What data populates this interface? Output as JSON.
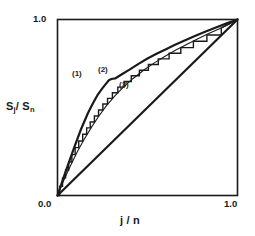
{
  "figure": {
    "kind": "lorenz-curve-plot",
    "background": "#ffffff",
    "ink": "#1a1a1a"
  },
  "axes": {
    "x_label": "j / n",
    "y_label_main": "S",
    "y_label_sub1": "j",
    "y_label_slash": "/ S",
    "y_label_sub2": "n",
    "y_label_plain": "Sj / Sn",
    "tick_origin": "0.0",
    "tick_x_right": "1.0",
    "tick_y_top": "1.0"
  },
  "curve_labels": {
    "one": "(1)",
    "two": "(2)",
    "three": "(3)"
  },
  "chart_data": {
    "type": "line",
    "title": "",
    "xlabel": "j / n",
    "ylabel": "Sj / Sn",
    "xlim": [
      0.0,
      1.0
    ],
    "ylim": [
      0.0,
      1.0
    ],
    "grid": false,
    "legend": "inline-annotations",
    "xticks": [
      0.0,
      1.0
    ],
    "yticks": [
      0.0,
      1.0
    ],
    "xticklabels": [
      "0.0",
      "1.0"
    ],
    "yticklabels": [
      "0.0",
      "1.0"
    ],
    "annotations": [
      {
        "text": "(1)",
        "x": 0.09,
        "y": 0.7
      },
      {
        "text": "(2)",
        "x": 0.23,
        "y": 0.73
      },
      {
        "text": "(3)",
        "x": 0.35,
        "y": 0.64
      }
    ],
    "series": [
      {
        "name": "(1)",
        "style": "thick-smooth",
        "linewidth": 2.2,
        "x": [
          0.0,
          0.02,
          0.05,
          0.09,
          0.13,
          0.17,
          0.2,
          0.225,
          0.25,
          0.27,
          0.285,
          0.3,
          0.32,
          0.36,
          0.4,
          0.45,
          0.5,
          0.55,
          0.6,
          0.65,
          0.7,
          0.76,
          0.82,
          0.88,
          0.94,
          1.0
        ],
        "y": [
          0.0,
          0.06,
          0.15,
          0.265,
          0.375,
          0.47,
          0.53,
          0.575,
          0.61,
          0.636,
          0.655,
          0.662,
          0.665,
          0.69,
          0.715,
          0.748,
          0.778,
          0.805,
          0.83,
          0.855,
          0.878,
          0.905,
          0.93,
          0.955,
          0.978,
          1.0
        ]
      },
      {
        "name": "(2)",
        "style": "staircase-jagged",
        "linewidth": 1.4,
        "x": [
          0.0,
          0.012,
          0.012,
          0.028,
          0.028,
          0.045,
          0.045,
          0.062,
          0.062,
          0.08,
          0.08,
          0.098,
          0.098,
          0.118,
          0.118,
          0.14,
          0.14,
          0.162,
          0.162,
          0.182,
          0.182,
          0.205,
          0.205,
          0.228,
          0.228,
          0.252,
          0.252,
          0.278,
          0.278,
          0.305,
          0.305,
          0.335,
          0.335,
          0.37,
          0.37,
          0.41,
          0.41,
          0.455,
          0.455,
          0.505,
          0.505,
          0.56,
          0.56,
          0.62,
          0.62,
          0.685,
          0.685,
          0.755,
          0.755,
          0.83,
          0.83,
          0.91,
          0.91,
          1.0
        ],
        "y": [
          0.0,
          0.0,
          0.052,
          0.052,
          0.1,
          0.1,
          0.145,
          0.145,
          0.19,
          0.19,
          0.232,
          0.232,
          0.272,
          0.272,
          0.31,
          0.31,
          0.348,
          0.348,
          0.384,
          0.384,
          0.418,
          0.418,
          0.452,
          0.452,
          0.486,
          0.486,
          0.52,
          0.52,
          0.552,
          0.552,
          0.584,
          0.584,
          0.616,
          0.616,
          0.648,
          0.648,
          0.68,
          0.68,
          0.712,
          0.712,
          0.744,
          0.744,
          0.776,
          0.776,
          0.808,
          0.808,
          0.84,
          0.84,
          0.876,
          0.876,
          0.912,
          0.912,
          0.952,
          1.0
        ]
      },
      {
        "name": "(3)",
        "style": "thin-smooth",
        "linewidth": 1.1,
        "x": [
          0.0,
          0.03,
          0.07,
          0.11,
          0.15,
          0.19,
          0.23,
          0.27,
          0.32,
          0.37,
          0.42,
          0.48,
          0.54,
          0.6,
          0.66,
          0.72,
          0.78,
          0.84,
          0.9,
          0.95,
          1.0
        ],
        "y": [
          0.0,
          0.075,
          0.165,
          0.248,
          0.322,
          0.39,
          0.452,
          0.508,
          0.568,
          0.62,
          0.665,
          0.713,
          0.755,
          0.793,
          0.828,
          0.86,
          0.89,
          0.92,
          0.948,
          0.972,
          1.0
        ]
      },
      {
        "name": "diagonal",
        "style": "thick-straight",
        "linewidth": 2.2,
        "x": [
          0.0,
          1.0
        ],
        "y": [
          0.0,
          1.0
        ]
      }
    ]
  }
}
